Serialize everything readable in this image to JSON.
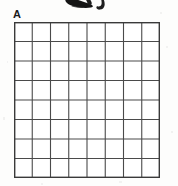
{
  "document": {
    "type": "scanned-worksheet-fragment",
    "background_color": "#fdfdfc",
    "width": 178,
    "height": 186
  },
  "panel": {
    "label": "A",
    "label_color": "#1b1b1b"
  },
  "top_ink": {
    "name": "cut-off-handwriting-ink",
    "description": "bottom tips of handwritten marks cropped by the top edge",
    "color": "#1a1a1a"
  },
  "grid": {
    "name": "answer-grid",
    "columns": 8,
    "rows": 8,
    "cell_width": 18.25,
    "cell_height": 19.5,
    "line_color": "#4a4a4a",
    "border_color": "#3a3a3a",
    "line_width": 1.1,
    "border_width": 1.4,
    "fill_color": "#ffffff",
    "cells": [
      [
        "",
        "",
        "",
        "",
        "",
        "",
        "",
        ""
      ],
      [
        "",
        "",
        "",
        "",
        "",
        "",
        "",
        ""
      ],
      [
        "",
        "",
        "",
        "",
        "",
        "",
        "",
        ""
      ],
      [
        "",
        "",
        "",
        "",
        "",
        "",
        "",
        ""
      ],
      [
        "",
        "",
        "",
        "",
        "",
        "",
        "",
        ""
      ],
      [
        "",
        "",
        "",
        "",
        "",
        "",
        "",
        ""
      ],
      [
        "",
        "",
        "",
        "",
        "",
        "",
        "",
        ""
      ],
      [
        "",
        "",
        "",
        "",
        "",
        "",
        "",
        ""
      ]
    ]
  }
}
